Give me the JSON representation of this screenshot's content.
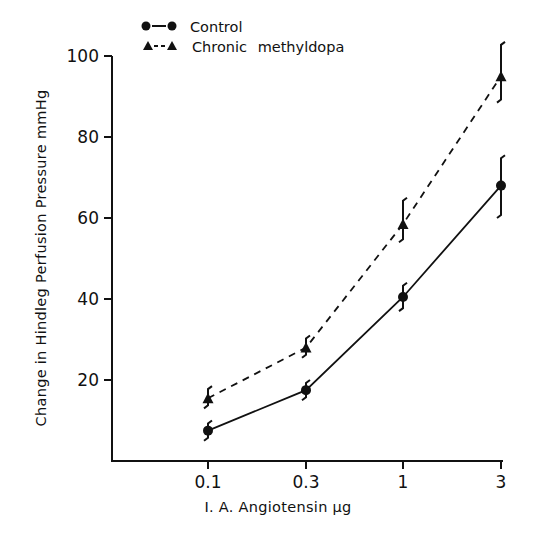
{
  "chart_data": {
    "type": "line",
    "title": "",
    "xlabel": "I. A. Angiotensin µg",
    "ylabel": "Change in Hindleg Perfusion Pressure mmHg",
    "categories": [
      "0.1",
      "0.3",
      "1",
      "3"
    ],
    "x_scale": "log (categorical ticks)",
    "ylim": [
      0,
      100
    ],
    "yticks": [
      20,
      40,
      60,
      80,
      100
    ],
    "grid": false,
    "legend_position": "top-left",
    "series": [
      {
        "name": "Control",
        "marker": "circle",
        "line_style": "solid",
        "values": [
          7.5,
          17.5,
          40.5,
          68
        ],
        "error": [
          [
            5,
            10
          ],
          [
            15,
            20
          ],
          [
            37,
            44
          ],
          [
            60,
            75.5
          ]
        ]
      },
      {
        "name": "Chronic methyldopa",
        "marker": "triangle",
        "line_style": "dashed",
        "values": [
          15.5,
          28,
          58.5,
          95
        ],
        "error": [
          [
            13,
            18.5
          ],
          [
            25.5,
            31
          ],
          [
            54,
            65
          ],
          [
            88.5,
            103.5
          ]
        ]
      }
    ]
  },
  "legend": {
    "items": [
      {
        "label": "Control"
      },
      {
        "label": "Chronic methyldopa"
      }
    ]
  },
  "axes": {
    "x_title": "I. A. Angiotensin µg",
    "y_title": "Change in Hindleg Perfusion Pressure mmHg",
    "x_ticks": [
      "0.1",
      "0.3",
      "1",
      "3"
    ],
    "y_ticks": [
      "20",
      "40",
      "60",
      "80",
      "100"
    ]
  },
  "style": {
    "ink": "#111111",
    "background": "#ffffff"
  }
}
